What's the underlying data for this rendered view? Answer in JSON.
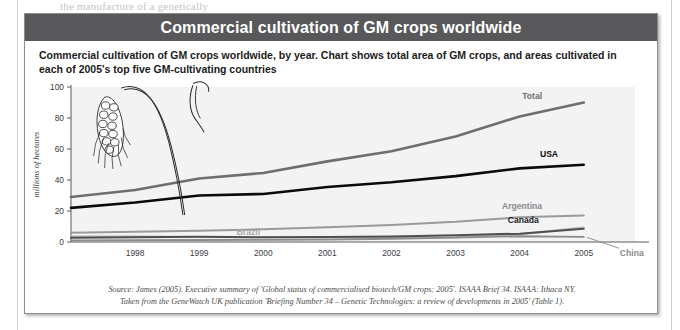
{
  "page_bleed_text": "the manufacture of a genetically",
  "figure": {
    "title": "Commercial cultivation of GM crops worldwide",
    "description": "Commercial cultivation of GM crops worldwide, by year. Chart shows total area of GM crops, and areas cultivated in each of 2005's top five GM-cultivating countries",
    "source_line_1": "Source: James (2005). Executive summary of 'Global status of commercialised biotech/GM crops: 2005'. ISAAA Brief 34. ISAAA: Ithaca NY.",
    "source_line_2": "Taken from the GeneWatch UK publication 'Briefing Number 34 – Genetic Technologies: a review of developments in 2005' (Table 1).",
    "header_bg": "#58585a",
    "decoration": "wheat-stalk-illustration"
  },
  "chart_data": {
    "type": "line",
    "title": "Commercial cultivation of GM crops worldwide",
    "xlabel": "",
    "ylabel": "millions of hectares",
    "x": [
      1997,
      1998,
      1999,
      2000,
      2001,
      2002,
      2003,
      2004,
      2005
    ],
    "tick_x": [
      1998,
      1999,
      2000,
      2001,
      2002,
      2003,
      2004,
      2005
    ],
    "ylim": [
      0,
      100
    ],
    "yticks": [
      0,
      20,
      40,
      60,
      80,
      100
    ],
    "xlim": [
      1997,
      2005.8
    ],
    "grid": false,
    "legend": "inline-end-labels",
    "series": [
      {
        "name": "Total",
        "color": "#6e6e70",
        "width": 2.6,
        "label_color": "#6e6e70",
        "values": [
          29.0,
          33.5,
          41.0,
          44.5,
          52.0,
          58.5,
          68.0,
          81.0,
          90.0
        ]
      },
      {
        "name": "USA",
        "color": "#0b0b0b",
        "width": 2.6,
        "label_color": "#0b0b0b",
        "values": [
          22.0,
          25.5,
          30.0,
          31.0,
          35.5,
          38.5,
          42.5,
          47.5,
          49.8
        ]
      },
      {
        "name": "Argentina",
        "color": "#9a9a9c",
        "width": 2.0,
        "label_color": "#8a8a8c",
        "values": [
          6.0,
          6.6,
          7.3,
          8.2,
          9.5,
          11.0,
          13.0,
          16.0,
          17.1
        ]
      },
      {
        "name": "Canada",
        "color": "#4f4f51",
        "width": 2.0,
        "label_color": "#1b1b1b",
        "values": [
          2.8,
          3.0,
          3.4,
          3.0,
          3.2,
          3.5,
          4.4,
          5.4,
          8.6
        ]
      },
      {
        "name": "Brazil",
        "color": "#b6b6b8",
        "width": 2.0,
        "label_color": "#a8a8aa",
        "values": [
          3.6,
          3.5,
          3.3,
          3.1,
          2.9,
          2.7,
          3.0,
          5.0,
          9.4
        ]
      },
      {
        "name": "China",
        "color": "#8c8c8e",
        "width": 1.8,
        "label_color": "#8a8a8c",
        "values": [
          1.1,
          1.2,
          1.3,
          1.4,
          1.5,
          2.1,
          2.8,
          3.7,
          3.3
        ]
      }
    ],
    "annotations": [
      {
        "text": "Total",
        "at_year": 2004.35,
        "at_value": 94.0
      },
      {
        "text": "USA",
        "at_year": 2004.6,
        "at_value": 57.0
      },
      {
        "text": "Argentina",
        "at_year": 2004.35,
        "at_value": 23.5
      },
      {
        "text": "Canada",
        "at_year": 2004.3,
        "at_value": 14.5
      },
      {
        "text": "Brazil",
        "at_year": 1999.95,
        "at_value": 6.5
      },
      {
        "text": "China",
        "at_year": 2005.75,
        "at_value": -7.0
      }
    ]
  }
}
